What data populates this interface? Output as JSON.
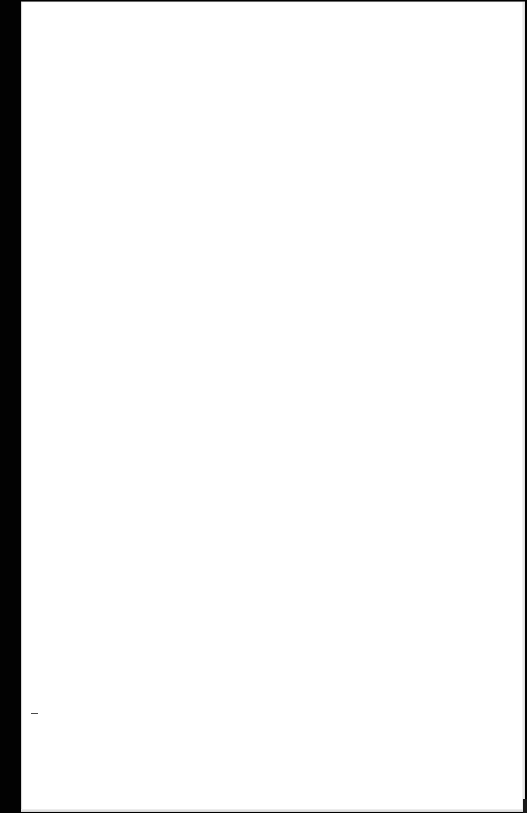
{
  "page": {
    "background_color": "#000000",
    "sheet_color": "#ffffff"
  },
  "sheet": {
    "content_text": "",
    "mark": "-"
  }
}
